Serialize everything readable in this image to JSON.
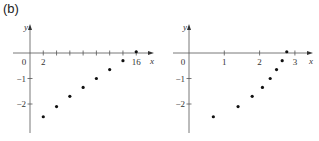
{
  "panel_label": "(b)",
  "chart_data": [
    {
      "type": "scatter",
      "title": "",
      "xlabel": "x",
      "ylabel": "y",
      "x_ticks": [
        {
          "value": 0,
          "label": "0"
        },
        {
          "value": 2,
          "label": "2"
        },
        {
          "value": 4,
          "label": ""
        },
        {
          "value": 6,
          "label": ""
        },
        {
          "value": 8,
          "label": ""
        },
        {
          "value": 10,
          "label": ""
        },
        {
          "value": 12,
          "label": ""
        },
        {
          "value": 14,
          "label": ""
        },
        {
          "value": 16,
          "label": "16"
        }
      ],
      "y_ticks": [
        {
          "value": -1,
          "label": "−1"
        },
        {
          "value": -2,
          "label": "−2"
        }
      ],
      "xlim": [
        -1.5,
        18.5
      ],
      "ylim": [
        -3.2,
        0.9
      ],
      "grid": false,
      "series": [
        {
          "name": "points",
          "x": [
            2,
            4,
            6,
            8,
            10,
            12,
            14,
            16
          ],
          "y": [
            -2.5,
            -2.1,
            -1.7,
            -1.35,
            -1.0,
            -0.65,
            -0.3,
            0.05
          ]
        }
      ]
    },
    {
      "type": "scatter",
      "title": "",
      "xlabel": "x",
      "ylabel": "y",
      "x_ticks": [
        {
          "value": 0,
          "label": "0"
        },
        {
          "value": 1,
          "label": "1"
        },
        {
          "value": 2,
          "label": "2"
        },
        {
          "value": 3,
          "label": "3"
        }
      ],
      "y_ticks": [
        {
          "value": -1,
          "label": "−1"
        },
        {
          "value": -2,
          "label": "−2"
        }
      ],
      "xlim": [
        -0.3,
        3.5
      ],
      "ylim": [
        -3.2,
        0.9
      ],
      "grid": false,
      "series": [
        {
          "name": "points",
          "x": [
            0.69,
            1.39,
            1.79,
            2.08,
            2.3,
            2.48,
            2.64,
            2.77
          ],
          "y": [
            -2.5,
            -2.1,
            -1.7,
            -1.35,
            -1.0,
            -0.65,
            -0.3,
            0.05
          ]
        }
      ]
    }
  ]
}
